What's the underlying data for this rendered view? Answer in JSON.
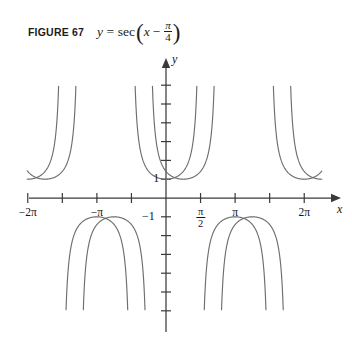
{
  "figure": {
    "label": "FIGURE 67",
    "equation": {
      "lhs": "y",
      "equals": "=",
      "function": "sec",
      "open_paren": "(",
      "argument_var": "x",
      "operator": "−",
      "fraction_numerator": "π",
      "fraction_denominator": "4",
      "close_paren": ")",
      "plain": "y = sec(x − π/4)"
    }
  },
  "axes": {
    "x_axis_name": "x",
    "y_axis_name": "y",
    "y_value_positive_label": "1",
    "y_value_negative_label": "−1"
  },
  "chart_data": {
    "type": "line",
    "xlabel": "x",
    "ylabel": "y",
    "xlim": [
      -7.4,
      7.6
    ],
    "ylim": [
      -6.2,
      6.2
    ],
    "grid": false,
    "legend": null,
    "x_ticks": [
      {
        "value": -6.2832,
        "label": "−2π"
      },
      {
        "value": -4.7124,
        "label": ""
      },
      {
        "value": -3.1416,
        "label": "−π"
      },
      {
        "value": -1.5708,
        "label": ""
      },
      {
        "value": 1.5708,
        "label": "π/2",
        "numerator": "π",
        "denominator": "2"
      },
      {
        "value": 3.1416,
        "label": "π"
      },
      {
        "value": 4.7124,
        "label": ""
      },
      {
        "value": 6.2832,
        "label": "2π"
      }
    ],
    "y_ticks": [
      {
        "value": 1,
        "label": "1"
      },
      {
        "value": 2,
        "label": ""
      },
      {
        "value": 3,
        "label": ""
      },
      {
        "value": 4,
        "label": ""
      },
      {
        "value": 5,
        "label": ""
      },
      {
        "value": 6,
        "label": ""
      },
      {
        "value": -1,
        "label": "−1"
      },
      {
        "value": -2,
        "label": ""
      },
      {
        "value": -3,
        "label": ""
      },
      {
        "value": -4,
        "label": ""
      },
      {
        "value": -5,
        "label": ""
      },
      {
        "value": -6,
        "label": ""
      }
    ],
    "series": [
      {
        "name": "y = sec x",
        "formula": "sec(x)",
        "phase_shift": 0,
        "color": "#6e6e6e",
        "asymptotes": [
          -7.854,
          -4.712,
          -1.571,
          1.571,
          4.712,
          7.854
        ],
        "minima": [
          {
            "x": -6.2832,
            "y": 1
          },
          {
            "x": 0,
            "y": 1
          },
          {
            "x": 6.2832,
            "y": 1
          }
        ],
        "maxima": [
          {
            "x": -3.1416,
            "y": -1
          },
          {
            "x": 3.1416,
            "y": -1
          }
        ]
      },
      {
        "name": "y = sec(x − π/4)",
        "formula": "sec(x - pi/4)",
        "phase_shift": 0.7854,
        "color": "#6e6e6e",
        "asymptotes": [
          -7.069,
          -3.927,
          -0.785,
          2.356,
          5.498
        ],
        "minima": [
          {
            "x": -5.4978,
            "y": 1
          },
          {
            "x": 0.7854,
            "y": 1
          },
          {
            "x": 7.0686,
            "y": 1
          }
        ],
        "maxima": [
          {
            "x": -2.3562,
            "y": -1
          },
          {
            "x": 3.927,
            "y": -1
          }
        ]
      }
    ],
    "annotations": [
      {
        "text": "1",
        "x": -0.35,
        "y": 1,
        "note": "y-value label at curve minimum"
      },
      {
        "text": "−1",
        "x": -0.45,
        "y": -1,
        "note": "y-value label below axis"
      }
    ]
  },
  "colors": {
    "curve": "#6e6e6e",
    "axis": "#3a3a3a",
    "text": "#141414",
    "background": "#ffffff"
  }
}
